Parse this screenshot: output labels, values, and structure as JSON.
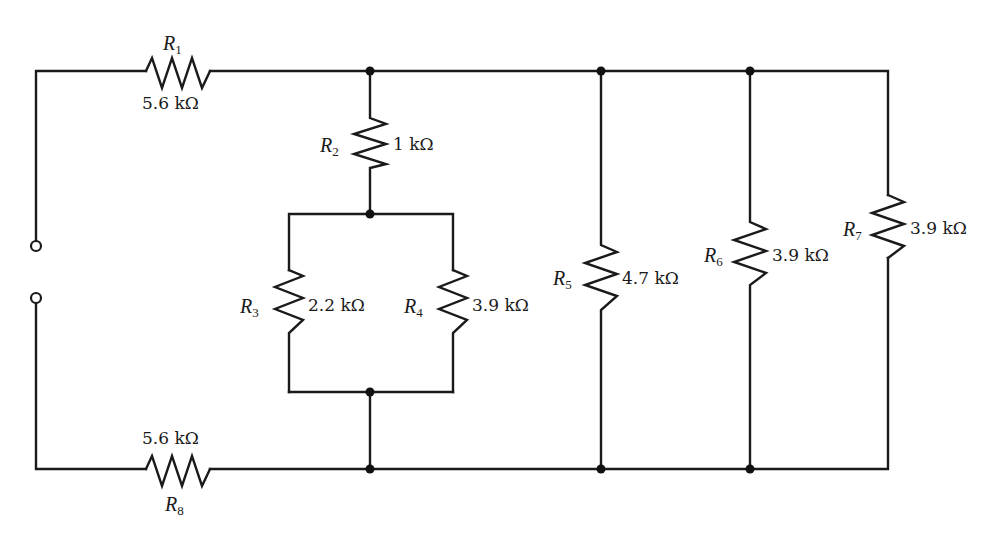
{
  "figure": {
    "type": "resistor-circuit-schematic",
    "colors": {
      "wire": "#1a1a1a",
      "background": "#ffffff"
    },
    "terminals": [
      {
        "id": "terminal-top",
        "x": 36,
        "y": 246
      },
      {
        "id": "terminal-bottom",
        "x": 36,
        "y": 298
      }
    ],
    "resistors": [
      {
        "id": "R1",
        "symbol": "R",
        "subscript": "1",
        "value": "5.6 kΩ",
        "position": "top wire, series"
      },
      {
        "id": "R2",
        "symbol": "R",
        "subscript": "2",
        "value": "1 kΩ",
        "position": "vertical, in series with R3||R4"
      },
      {
        "id": "R3",
        "symbol": "R",
        "subscript": "3",
        "value": "2.2 kΩ",
        "position": "parallel with R4"
      },
      {
        "id": "R4",
        "symbol": "R",
        "subscript": "4",
        "value": "3.9 kΩ",
        "position": "parallel with R3"
      },
      {
        "id": "R5",
        "symbol": "R",
        "subscript": "5",
        "value": "4.7 kΩ",
        "position": "shunt branch"
      },
      {
        "id": "R6",
        "symbol": "R",
        "subscript": "6",
        "value": "3.9 kΩ",
        "position": "shunt branch"
      },
      {
        "id": "R7",
        "symbol": "R",
        "subscript": "7",
        "value": "3.9 kΩ",
        "position": "rightmost shunt branch"
      },
      {
        "id": "R8",
        "symbol": "R",
        "subscript": "8",
        "value": "5.6 kΩ",
        "position": "bottom wire, series"
      }
    ],
    "nodes": [
      {
        "x": 370,
        "y": 71
      },
      {
        "x": 601,
        "y": 71
      },
      {
        "x": 750,
        "y": 71
      },
      {
        "x": 370,
        "y": 214
      },
      {
        "x": 370,
        "y": 392
      },
      {
        "x": 370,
        "y": 469
      },
      {
        "x": 601,
        "y": 469
      },
      {
        "x": 750,
        "y": 469
      }
    ]
  }
}
